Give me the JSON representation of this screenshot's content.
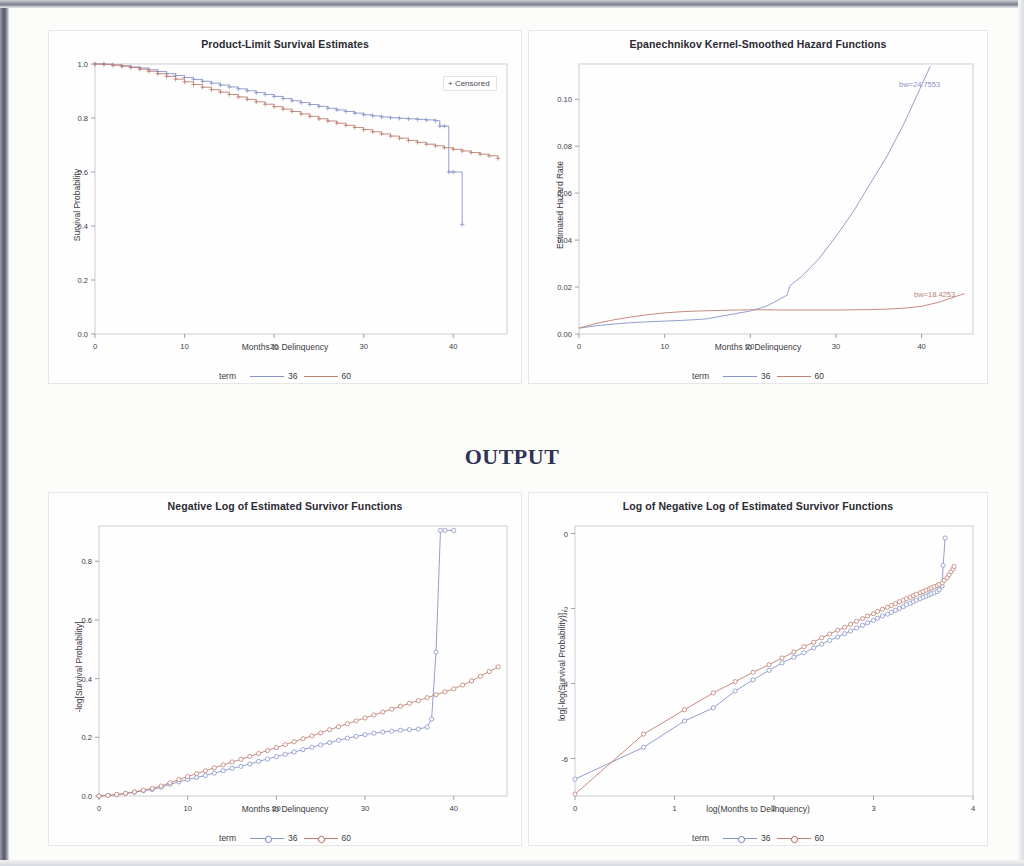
{
  "document": {
    "output_heading": "OUTPUT"
  },
  "common": {
    "legend_term_label": "term",
    "series_36": "36",
    "series_60": "60",
    "color_36": "#8894c8",
    "color_60": "#c07f72"
  },
  "charts": [
    {
      "id": "product-limit-survival-estimates",
      "title": "Product-Limit Survival Estimates",
      "censored_label": "+ Censored",
      "xlabel": "Months to Delinquency",
      "ylabel": "Survival Probability",
      "xticks": [
        "0",
        "10",
        "20",
        "30",
        "40"
      ],
      "yticks": [
        "0.0",
        "0.2",
        "0.4",
        "0.6",
        "0.8",
        "1.0"
      ]
    },
    {
      "id": "epanechnikov-kernel-smoothed-hazard-functions",
      "title": "Epanechnikov Kernel-Smoothed Hazard Functions",
      "xlabel": "Months to Delinquency",
      "ylabel": "Estimated Hazard Rate",
      "xticks": [
        "0",
        "10",
        "20",
        "30",
        "40"
      ],
      "yticks": [
        "0.00",
        "0.02",
        "0.04",
        "0.06",
        "0.08",
        "0.10"
      ],
      "bw_label_36": "bw=24.7553",
      "bw_label_60": "bw=18.4253"
    },
    {
      "id": "negative-log-of-estimated-survivor-functions",
      "title": "Negative Log of Estimated Survivor Functions",
      "xlabel": "Months to Delinquency",
      "ylabel": "-log[Survival Probability]",
      "xticks": [
        "0",
        "10",
        "20",
        "30",
        "40"
      ],
      "yticks": [
        "0.0",
        "0.2",
        "0.4",
        "0.6",
        "0.8"
      ]
    },
    {
      "id": "log-of-negative-log-of-estimated-survivor-functions",
      "title": "Log of Negative Log of Estimated Survivor Functions",
      "xlabel": "log(Months to Delinquency)",
      "ylabel": "log[-log(Survival Probability)]",
      "xticks": [
        "0",
        "1",
        "2",
        "3",
        "4"
      ],
      "yticks": [
        "-6",
        "-4",
        "-2",
        "0"
      ]
    }
  ],
  "chart_data": [
    {
      "type": "line",
      "id": "product-limit-survival-estimates",
      "title": "Product-Limit Survival Estimates",
      "xlabel": "Months to Delinquency",
      "ylabel": "Survival Probability",
      "xlim": [
        0,
        46
      ],
      "ylim": [
        0.0,
        1.0
      ],
      "grid": false,
      "legend": "bottom",
      "step": true,
      "annotations": [
        "+ Censored"
      ],
      "series": [
        {
          "name": "36",
          "color": "#8894c8",
          "x": [
            0,
            1,
            2,
            3,
            4,
            5,
            6,
            7,
            8,
            9,
            10,
            11,
            12,
            13,
            14,
            15,
            16,
            17,
            18,
            19,
            20,
            21,
            22,
            23,
            24,
            25,
            26,
            27,
            28,
            29,
            30,
            31,
            32,
            33,
            34,
            35,
            36,
            37,
            38,
            38.5,
            39,
            39.5,
            40,
            41
          ],
          "y": [
            1.0,
            0.999,
            0.996,
            0.993,
            0.989,
            0.985,
            0.979,
            0.972,
            0.964,
            0.957,
            0.95,
            0.943,
            0.936,
            0.929,
            0.922,
            0.915,
            0.908,
            0.901,
            0.894,
            0.887,
            0.88,
            0.872,
            0.864,
            0.857,
            0.85,
            0.843,
            0.836,
            0.83,
            0.824,
            0.818,
            0.812,
            0.808,
            0.804,
            0.801,
            0.799,
            0.797,
            0.795,
            0.793,
            0.79,
            0.77,
            0.77,
            0.6,
            0.6,
            0.405
          ]
        },
        {
          "name": "60",
          "color": "#c07f72",
          "x": [
            0,
            1,
            2,
            3,
            4,
            5,
            6,
            7,
            8,
            9,
            10,
            11,
            12,
            13,
            14,
            15,
            16,
            17,
            18,
            19,
            20,
            21,
            22,
            23,
            24,
            25,
            26,
            27,
            28,
            29,
            30,
            31,
            32,
            33,
            34,
            35,
            36,
            37,
            38,
            39,
            40,
            41,
            42,
            43,
            44,
            45
          ],
          "y": [
            1.0,
            0.999,
            0.996,
            0.992,
            0.987,
            0.981,
            0.973,
            0.964,
            0.954,
            0.944,
            0.934,
            0.924,
            0.914,
            0.905,
            0.896,
            0.887,
            0.878,
            0.869,
            0.86,
            0.851,
            0.842,
            0.833,
            0.824,
            0.815,
            0.806,
            0.797,
            0.789,
            0.781,
            0.773,
            0.765,
            0.757,
            0.749,
            0.741,
            0.733,
            0.725,
            0.717,
            0.71,
            0.703,
            0.697,
            0.69,
            0.684,
            0.678,
            0.672,
            0.666,
            0.66,
            0.65
          ]
        }
      ]
    },
    {
      "type": "line",
      "id": "epanechnikov-kernel-smoothed-hazard-functions",
      "title": "Epanechnikov Kernel-Smoothed Hazard Functions",
      "xlabel": "Months to Delinquency",
      "ylabel": "Estimated Hazard Rate",
      "xlim": [
        0,
        46
      ],
      "ylim": [
        0.0,
        0.115
      ],
      "grid": false,
      "legend": "bottom",
      "annotations": [
        "bw=24.7553",
        "bw=18.4253"
      ],
      "series": [
        {
          "name": "36",
          "color": "#8894c8",
          "bandwidth": 24.7553,
          "x": [
            0,
            2,
            4,
            6,
            8,
            10,
            12,
            14,
            15,
            16,
            18,
            20,
            22,
            24,
            24.3,
            24.6,
            26,
            28,
            30,
            32,
            34,
            36,
            38,
            40,
            41
          ],
          "y": [
            0.0025,
            0.0035,
            0.0042,
            0.0048,
            0.0052,
            0.0055,
            0.0058,
            0.0062,
            0.0065,
            0.0072,
            0.0085,
            0.0098,
            0.012,
            0.016,
            0.0165,
            0.0205,
            0.0245,
            0.032,
            0.0415,
            0.052,
            0.064,
            0.076,
            0.09,
            0.106,
            0.114
          ]
        },
        {
          "name": "60",
          "color": "#c07f72",
          "bandwidth": 18.4253,
          "x": [
            0,
            2,
            4,
            6,
            8,
            10,
            12,
            14,
            16,
            18,
            20,
            22,
            24,
            26,
            28,
            30,
            32,
            34,
            36,
            38,
            40,
            42,
            44,
            45
          ],
          "y": [
            0.0025,
            0.0045,
            0.006,
            0.0072,
            0.0082,
            0.009,
            0.0095,
            0.0098,
            0.01,
            0.0102,
            0.0103,
            0.0103,
            0.0102,
            0.0102,
            0.0102,
            0.0102,
            0.0103,
            0.0104,
            0.0106,
            0.011,
            0.0118,
            0.0135,
            0.016,
            0.0172
          ]
        }
      ]
    },
    {
      "type": "line",
      "id": "negative-log-of-estimated-survivor-functions",
      "title": "Negative Log of Estimated Survivor Functions",
      "xlabel": "Months to Delinquency",
      "ylabel": "-log[Survival Probability]",
      "xlim": [
        0,
        46
      ],
      "ylim": [
        0.0,
        0.92
      ],
      "grid": false,
      "legend": "bottom",
      "markers": "circle",
      "series": [
        {
          "name": "36",
          "color": "#8894c8",
          "x": [
            0,
            1,
            2,
            3,
            4,
            5,
            6,
            7,
            8,
            9,
            10,
            11,
            12,
            13,
            14,
            15,
            16,
            17,
            18,
            19,
            20,
            21,
            22,
            23,
            24,
            25,
            26,
            27,
            28,
            29,
            30,
            31,
            32,
            33,
            34,
            35,
            36,
            37,
            37.5,
            38,
            38.5,
            39,
            40
          ],
          "y": [
            0.0,
            0.002,
            0.005,
            0.009,
            0.013,
            0.018,
            0.022,
            0.03,
            0.04,
            0.048,
            0.056,
            0.063,
            0.07,
            0.078,
            0.086,
            0.094,
            0.101,
            0.109,
            0.118,
            0.126,
            0.134,
            0.142,
            0.15,
            0.158,
            0.166,
            0.174,
            0.182,
            0.19,
            0.197,
            0.203,
            0.209,
            0.214,
            0.218,
            0.221,
            0.224,
            0.226,
            0.228,
            0.235,
            0.262,
            0.49,
            0.905,
            0.905,
            0.905
          ]
        },
        {
          "name": "60",
          "color": "#c07f72",
          "x": [
            0,
            1,
            2,
            3,
            4,
            5,
            6,
            7,
            8,
            9,
            10,
            11,
            12,
            13,
            14,
            15,
            16,
            17,
            18,
            19,
            20,
            21,
            22,
            23,
            24,
            25,
            26,
            27,
            28,
            29,
            30,
            31,
            32,
            33,
            34,
            35,
            36,
            37,
            38,
            39,
            40,
            41,
            42,
            43,
            44,
            45
          ],
          "y": [
            0.0,
            0.002,
            0.005,
            0.009,
            0.014,
            0.02,
            0.026,
            0.034,
            0.045,
            0.056,
            0.066,
            0.076,
            0.086,
            0.096,
            0.106,
            0.116,
            0.125,
            0.135,
            0.145,
            0.155,
            0.165,
            0.175,
            0.185,
            0.195,
            0.205,
            0.215,
            0.226,
            0.236,
            0.246,
            0.256,
            0.266,
            0.276,
            0.286,
            0.296,
            0.306,
            0.316,
            0.325,
            0.335,
            0.345,
            0.355,
            0.365,
            0.378,
            0.392,
            0.408,
            0.424,
            0.44
          ]
        }
      ]
    },
    {
      "type": "line",
      "id": "log-of-negative-log-of-estimated-survivor-functions",
      "title": "Log of Negative Log of Estimated Survivor Functions",
      "xlabel": "log(Months to Delinquency)",
      "ylabel": "log[-log(Survival Probability)]",
      "xlim": [
        0,
        4
      ],
      "ylim": [
        -7.0,
        0.2
      ],
      "grid": false,
      "legend": "bottom",
      "markers": "circle",
      "series": [
        {
          "name": "36",
          "color": "#8894c8",
          "x": [
            0.0,
            0.69,
            1.1,
            1.39,
            1.61,
            1.79,
            1.95,
            2.08,
            2.2,
            2.3,
            2.4,
            2.48,
            2.56,
            2.64,
            2.71,
            2.77,
            2.83,
            2.89,
            2.94,
            3.0,
            3.04,
            3.09,
            3.14,
            3.18,
            3.22,
            3.26,
            3.3,
            3.33,
            3.37,
            3.4,
            3.43,
            3.47,
            3.5,
            3.53,
            3.56,
            3.58,
            3.61,
            3.64,
            3.66,
            3.69,
            3.7,
            3.72
          ],
          "y": [
            -6.55,
            -5.7,
            -5.0,
            -4.65,
            -4.2,
            -3.9,
            -3.65,
            -3.45,
            -3.3,
            -3.18,
            -3.05,
            -2.95,
            -2.85,
            -2.76,
            -2.67,
            -2.6,
            -2.52,
            -2.45,
            -2.38,
            -2.32,
            -2.26,
            -2.2,
            -2.15,
            -2.1,
            -2.05,
            -2.0,
            -1.95,
            -1.9,
            -1.86,
            -1.82,
            -1.78,
            -1.74,
            -1.7,
            -1.67,
            -1.64,
            -1.61,
            -1.58,
            -1.55,
            -1.5,
            -1.4,
            -0.85,
            -0.12
          ]
        },
        {
          "name": "60",
          "color": "#c07f72",
          "x": [
            0.0,
            0.69,
            1.1,
            1.39,
            1.61,
            1.79,
            1.95,
            2.08,
            2.2,
            2.3,
            2.4,
            2.48,
            2.56,
            2.64,
            2.71,
            2.77,
            2.83,
            2.89,
            2.94,
            3.0,
            3.04,
            3.09,
            3.14,
            3.18,
            3.22,
            3.26,
            3.3,
            3.33,
            3.37,
            3.4,
            3.43,
            3.47,
            3.5,
            3.53,
            3.56,
            3.58,
            3.61,
            3.64,
            3.66,
            3.69,
            3.71,
            3.74,
            3.76,
            3.78,
            3.8,
            3.81
          ],
          "y": [
            -6.95,
            -5.35,
            -4.7,
            -4.25,
            -3.95,
            -3.7,
            -3.5,
            -3.32,
            -3.16,
            -3.02,
            -2.9,
            -2.78,
            -2.68,
            -2.58,
            -2.5,
            -2.42,
            -2.34,
            -2.27,
            -2.2,
            -2.14,
            -2.08,
            -2.02,
            -1.97,
            -1.92,
            -1.87,
            -1.82,
            -1.78,
            -1.74,
            -1.7,
            -1.66,
            -1.62,
            -1.58,
            -1.55,
            -1.51,
            -1.48,
            -1.45,
            -1.42,
            -1.39,
            -1.36,
            -1.32,
            -1.25,
            -1.18,
            -1.1,
            -1.02,
            -0.95,
            -0.88
          ]
        }
      ]
    }
  ]
}
